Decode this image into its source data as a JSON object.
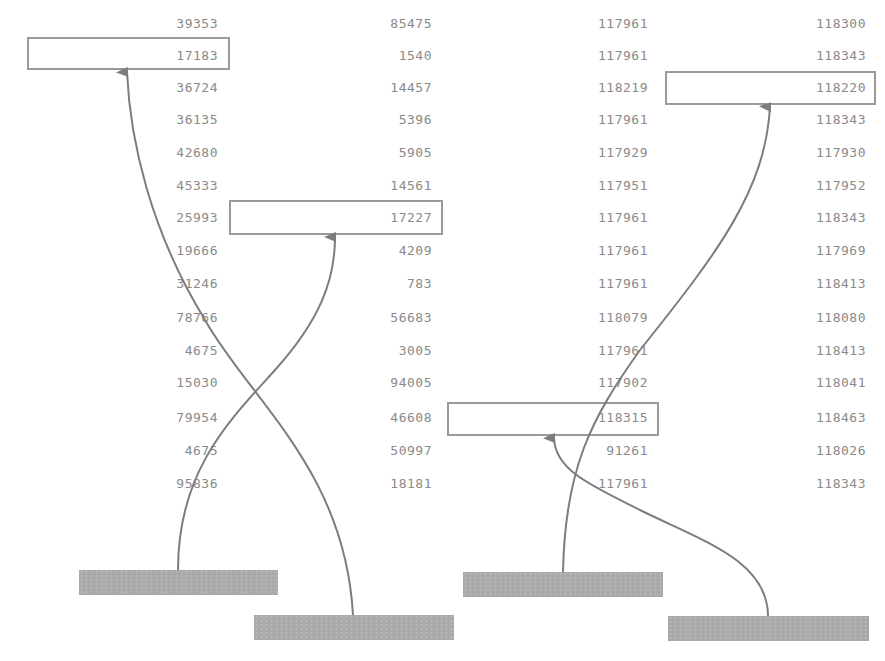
{
  "columns": [
    {
      "id": "c1",
      "right": 218,
      "values": [
        "39353",
        "17183",
        "36724",
        "36135",
        "42680",
        "45333",
        "25993",
        "19666",
        "31246",
        "78766",
        "4675",
        "15030",
        "79954",
        "4675",
        "95836"
      ]
    },
    {
      "id": "c2",
      "right": 432,
      "values": [
        "85475",
        "1540",
        "14457",
        "5396",
        "5905",
        "14561",
        "17227",
        "4209",
        "783",
        "56683",
        "3005",
        "94005",
        "46608",
        "50997",
        "18181"
      ]
    },
    {
      "id": "c3",
      "right": 648,
      "values": [
        "117961",
        "117961",
        "118219",
        "117961",
        "117929",
        "117951",
        "117961",
        "117961",
        "117961",
        "118079",
        "117961",
        "117902",
        "118315",
        "91261",
        "117961"
      ]
    },
    {
      "id": "c4",
      "right": 866,
      "values": [
        "118300",
        "118343",
        "118220",
        "118343",
        "117930",
        "117952",
        "118343",
        "117969",
        "118413",
        "118080",
        "118413",
        "118041",
        "118463",
        "118026",
        "118343"
      ]
    }
  ],
  "highlights": [
    {
      "column": "c1",
      "row": 1,
      "value": "17183"
    },
    {
      "column": "c2",
      "row": 6,
      "value": "17227"
    },
    {
      "column": "c4",
      "row": 2,
      "value": "118220"
    },
    {
      "column": "c3",
      "row": 12,
      "value": "118315"
    }
  ],
  "bars": [
    {
      "id": "bar-1",
      "label": ""
    },
    {
      "id": "bar-2",
      "label": ""
    },
    {
      "id": "bar-3",
      "label": ""
    },
    {
      "id": "bar-4",
      "label": ""
    }
  ],
  "colors": {
    "text": "#8a8a8a",
    "box": "#9a9a9a",
    "bar": "#a9a9a9",
    "arrow": "#7d7d7d"
  }
}
